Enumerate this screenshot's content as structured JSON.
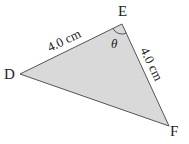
{
  "diagram": {
    "type": "triangle",
    "fill_color": "#d9d9d9",
    "stroke_color": "#555555",
    "vertices": {
      "D": "D",
      "E": "E",
      "F": "F"
    },
    "sides": {
      "DE": "4.0 cm",
      "EF": "4.0 cm"
    },
    "angle": {
      "at": "E",
      "label": "θ"
    }
  }
}
